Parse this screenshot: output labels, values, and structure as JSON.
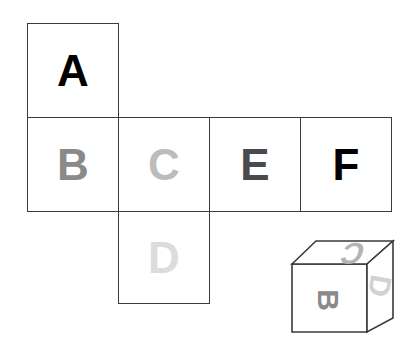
{
  "figure": {
    "background_color": "#ffffff",
    "line_color": "#3a3a3a"
  },
  "net": {
    "description": "Unfolded cube net made of six squares arranged in a cross/T shape",
    "squares": [
      {
        "id": "A",
        "label": "A",
        "color": "#000000",
        "row": "top",
        "column": 1
      },
      {
        "id": "B",
        "label": "B",
        "color": "#8a8a8a",
        "row": "middle",
        "column": 1
      },
      {
        "id": "C",
        "label": "C",
        "color": "#bcbcbc",
        "row": "middle",
        "column": 2
      },
      {
        "id": "E",
        "label": "E",
        "color": "#4a4a4a",
        "row": "middle",
        "column": 3
      },
      {
        "id": "F",
        "label": "F",
        "color": "#000000",
        "row": "middle",
        "column": 4
      },
      {
        "id": "D",
        "label": "D",
        "color": "#dcdcdc",
        "row": "bottom",
        "column": 2
      }
    ]
  },
  "cube": {
    "description": "Folded cube shown in isometric view with three visible faces",
    "faces": [
      {
        "id": "cube-front",
        "label": "B",
        "color": "#8a8a8a",
        "rotation_deg": 90,
        "position": "front"
      },
      {
        "id": "cube-top",
        "label": "C",
        "color": "#b4b4b4",
        "rotation_deg": 180,
        "position": "top"
      },
      {
        "id": "cube-right",
        "label": "D",
        "color": "#d2d2d2",
        "rotation_deg": 100,
        "position": "right"
      }
    ]
  }
}
